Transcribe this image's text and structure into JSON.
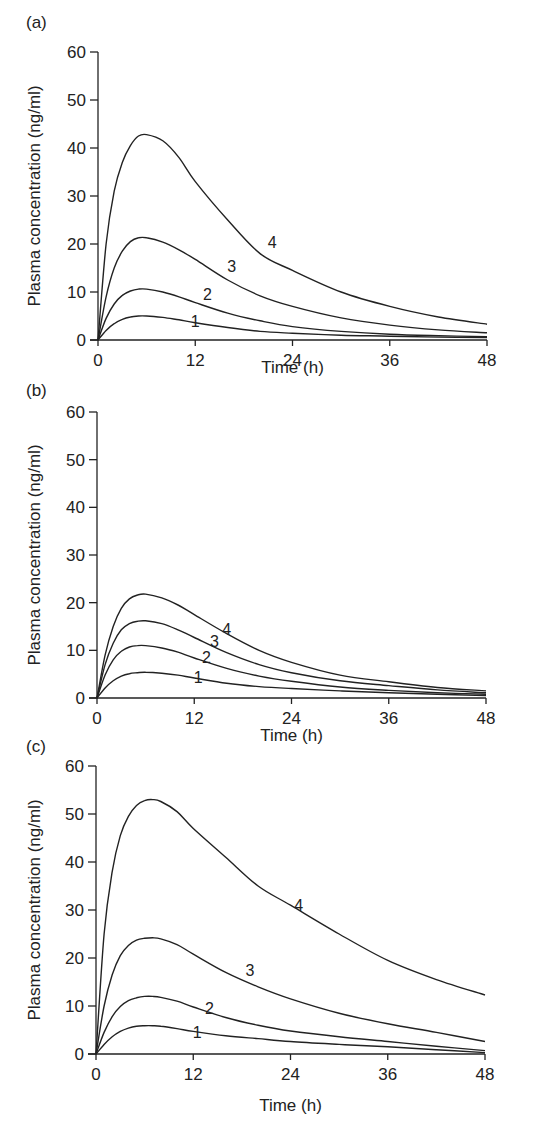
{
  "chart_data": [
    {
      "panel": "(a)",
      "type": "line",
      "title": "",
      "xlabel": "Time (h)",
      "ylabel": "Plasma concentration (ng/ml)",
      "xlim": [
        0,
        48
      ],
      "ylim": [
        0,
        60
      ],
      "xticks": [
        0,
        12,
        24,
        36,
        48
      ],
      "yticks": [
        0,
        10,
        20,
        30,
        40,
        50,
        60
      ],
      "grid": false,
      "x": [
        0,
        1,
        2,
        3,
        4,
        5,
        6,
        8,
        10,
        12,
        16,
        20,
        24,
        30,
        36,
        42,
        48
      ],
      "series": [
        {
          "name": "1",
          "label_at": [
            12,
            4
          ],
          "values": [
            0,
            2.0,
            3.4,
            4.3,
            4.8,
            5.0,
            5.0,
            4.7,
            4.2,
            3.6,
            2.6,
            1.8,
            1.4,
            1.0,
            0.8,
            0.6,
            0.5
          ]
        },
        {
          "name": "2",
          "label_at": [
            13.5,
            9.5
          ],
          "values": [
            0,
            4.5,
            7.5,
            9.3,
            10.2,
            10.6,
            10.6,
            10.0,
            9.0,
            7.8,
            5.6,
            4.0,
            2.8,
            1.8,
            1.2,
            0.9,
            0.7
          ]
        },
        {
          "name": "3",
          "label_at": [
            16.5,
            15.5
          ],
          "values": [
            0,
            9.0,
            15.0,
            18.5,
            20.5,
            21.3,
            21.3,
            20.4,
            18.8,
            16.8,
            12.5,
            9.2,
            7.0,
            4.6,
            3.1,
            2.1,
            1.5
          ]
        },
        {
          "name": "4",
          "label_at": [
            21.5,
            20.5
          ],
          "values": [
            0,
            20.0,
            31.0,
            37.0,
            40.5,
            42.5,
            42.8,
            41.5,
            38.0,
            33.0,
            25.0,
            18.0,
            14.5,
            10.0,
            7.0,
            4.8,
            3.3
          ]
        }
      ]
    },
    {
      "panel": "(b)",
      "type": "line",
      "title": "",
      "xlabel": "Time (h)",
      "ylabel": "Plasma concentration (ng/ml)",
      "xlim": [
        0,
        48
      ],
      "ylim": [
        0,
        60
      ],
      "xticks": [
        0,
        12,
        24,
        36,
        48
      ],
      "yticks": [
        0,
        10,
        20,
        30,
        40,
        50,
        60
      ],
      "grid": false,
      "x": [
        0,
        1,
        2,
        3,
        4,
        5,
        6,
        8,
        10,
        12,
        16,
        20,
        24,
        30,
        36,
        42,
        48
      ],
      "series": [
        {
          "name": "1",
          "label_at": [
            12.5,
            4.5
          ],
          "values": [
            0,
            2.1,
            3.6,
            4.6,
            5.1,
            5.3,
            5.4,
            5.2,
            4.8,
            4.2,
            3.1,
            2.4,
            2.0,
            1.5,
            1.1,
            0.8,
            0.5
          ]
        },
        {
          "name": "2",
          "label_at": [
            13.5,
            8.5
          ],
          "values": [
            0,
            4.8,
            8.0,
            9.8,
            10.7,
            11.0,
            11.0,
            10.5,
            9.6,
            8.4,
            6.2,
            4.6,
            3.5,
            2.3,
            1.6,
            1.1,
            0.8
          ]
        },
        {
          "name": "3",
          "label_at": [
            14.5,
            12
          ],
          "values": [
            0,
            7.0,
            11.5,
            14.3,
            15.6,
            16.1,
            16.2,
            15.6,
            14.3,
            12.7,
            9.5,
            7.0,
            5.3,
            3.6,
            2.6,
            1.7,
            1.1
          ]
        },
        {
          "name": "4",
          "label_at": [
            16,
            14.5
          ],
          "values": [
            0,
            9.0,
            15.0,
            18.8,
            20.8,
            21.6,
            21.8,
            21.0,
            19.5,
            17.5,
            13.5,
            10.0,
            7.5,
            4.8,
            3.4,
            2.2,
            1.5
          ]
        }
      ]
    },
    {
      "panel": "(c)",
      "type": "line",
      "title": "",
      "xlabel": "Time (h)",
      "ylabel": "Plasma concentration (ng/ml)",
      "xlim": [
        0,
        48
      ],
      "ylim": [
        0,
        60
      ],
      "xticks": [
        0,
        12,
        24,
        36,
        48
      ],
      "yticks": [
        0,
        10,
        20,
        30,
        40,
        50,
        60
      ],
      "grid": false,
      "x": [
        0,
        1,
        2,
        3,
        4,
        5,
        6,
        7,
        8,
        10,
        12,
        16,
        20,
        24,
        30,
        36,
        42,
        48
      ],
      "series": [
        {
          "name": "1",
          "label_at": [
            12.5,
            4.5
          ],
          "values": [
            0,
            2.0,
            3.6,
            4.7,
            5.4,
            5.8,
            5.9,
            5.9,
            5.8,
            5.3,
            4.7,
            3.8,
            3.2,
            2.6,
            2.0,
            1.5,
            0.9,
            0.3
          ]
        },
        {
          "name": "2",
          "label_at": [
            14,
            9.5
          ],
          "values": [
            0,
            4.5,
            7.8,
            9.9,
            11.1,
            11.7,
            12.0,
            12.0,
            11.8,
            11.0,
            9.8,
            7.6,
            6.0,
            4.8,
            3.6,
            2.6,
            1.6,
            0.7
          ]
        },
        {
          "name": "3",
          "label_at": [
            19,
            17.5
          ],
          "values": [
            0,
            10.0,
            16.5,
            20.5,
            22.6,
            23.7,
            24.1,
            24.2,
            24.0,
            22.8,
            20.8,
            17.0,
            14.0,
            11.5,
            8.5,
            6.3,
            4.5,
            2.6
          ]
        },
        {
          "name": "4",
          "label_at": [
            25,
            31
          ],
          "values": [
            0,
            25.0,
            38.0,
            45.5,
            49.5,
            51.8,
            52.8,
            53.0,
            52.6,
            50.5,
            47.0,
            41.0,
            35.0,
            31.0,
            25.0,
            19.5,
            15.5,
            12.3
          ]
        }
      ]
    }
  ],
  "panels": [
    {
      "label": "(a)",
      "xlabel": "Time (h)",
      "ylabel": "Plasma concentration (ng/ml)"
    },
    {
      "label": "(b)",
      "xlabel": "Time (h)",
      "ylabel": "Plasma concentration (ng/ml)"
    },
    {
      "label": "(c)",
      "xlabel": "Time (h)",
      "ylabel": "Plasma concentration (ng/ml)"
    }
  ]
}
